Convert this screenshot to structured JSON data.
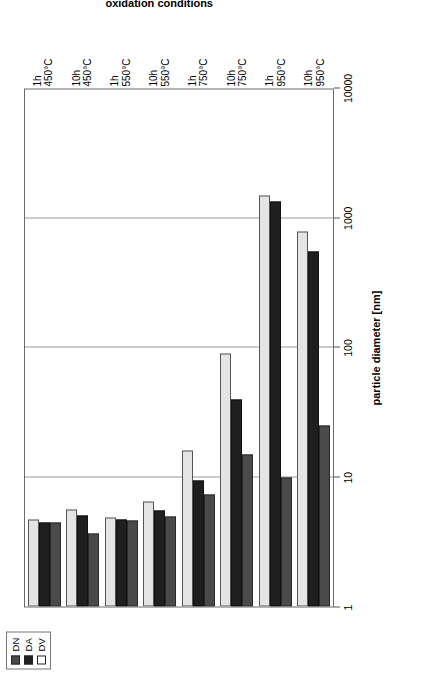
{
  "chart_data": {
    "type": "bar",
    "orientation": "horizontal",
    "title": "",
    "xlabel": "particle diameter [nm]",
    "ylabel": "oxidation conditions",
    "xscale": "log",
    "xlim": [
      1,
      10000
    ],
    "xticks": [
      "1",
      "10",
      "100",
      "1000",
      "10000"
    ],
    "xtick_values": [
      1,
      10,
      100,
      1000,
      10000
    ],
    "grid": true,
    "grid_axis": "x",
    "legend_position": "top-right",
    "categories": [
      "1h 450°C",
      "10h 450°C",
      "1h 550°C",
      "10h 550°C",
      "1h 750°C",
      "10h 750°C",
      "1h 950°C",
      "10h 950°C"
    ],
    "category_parts": [
      {
        "duration": "1h",
        "temperature": "450°C"
      },
      {
        "duration": "10h",
        "temperature": "450°C"
      },
      {
        "duration": "1h",
        "temperature": "550°C"
      },
      {
        "duration": "10h",
        "temperature": "550°C"
      },
      {
        "duration": "1h",
        "temperature": "750°C"
      },
      {
        "duration": "10h",
        "temperature": "750°C"
      },
      {
        "duration": "1h",
        "temperature": "950°C"
      },
      {
        "duration": "10h",
        "temperature": "950°C"
      }
    ],
    "series": [
      {
        "name": "DN",
        "color": "#4a4a4a",
        "values": [
          4.5,
          3.7,
          4.6,
          5.0,
          7.3,
          15,
          10,
          25
        ]
      },
      {
        "name": "DA",
        "color": "#1f1f1f",
        "values": [
          4.5,
          5.1,
          4.7,
          5.5,
          9.5,
          40,
          1350,
          560
        ]
      },
      {
        "name": "DV",
        "color": "#e4e4e4",
        "values": [
          4.7,
          5.6,
          4.9,
          6.5,
          16,
          90,
          1500,
          800
        ]
      }
    ]
  },
  "legend": {
    "entries": [
      {
        "label": "DN",
        "swatch": "#4a4a4a"
      },
      {
        "label": "DA",
        "swatch": "#1f1f1f"
      },
      {
        "label": "DV",
        "swatch": "#ffffff"
      }
    ]
  },
  "axes": {
    "value_axis_title": "particle diameter [nm]",
    "category_axis_title": "oxidation conditions",
    "tick_labels": [
      "1",
      "10",
      "100",
      "1000",
      "10000"
    ]
  }
}
